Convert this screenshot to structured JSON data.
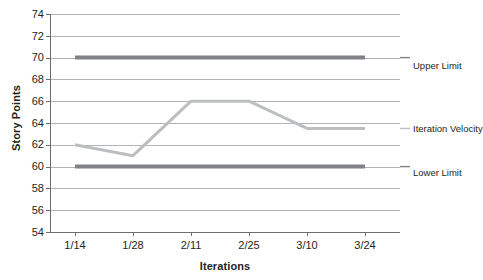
{
  "chart_data": {
    "type": "line",
    "title": "",
    "xlabel": "Iterations",
    "ylabel": "Story Points",
    "categories": [
      "1/14",
      "1/28",
      "2/11",
      "2/25",
      "3/10",
      "3/24"
    ],
    "ylim": [
      54,
      74
    ],
    "yticks": [
      74,
      72,
      70,
      68,
      66,
      64,
      62,
      60,
      58,
      56,
      54
    ],
    "grid": true,
    "legend_position": "right-inline",
    "series": [
      {
        "name": "Upper Limit",
        "values": [
          70,
          70,
          70,
          70,
          70,
          70
        ],
        "color": "#808285",
        "width": 4
      },
      {
        "name": "Iteration Velocity",
        "values": [
          62,
          61,
          66,
          66,
          63.5,
          63.5
        ],
        "color": "#bcbec0",
        "width": 3
      },
      {
        "name": "Lower Limit",
        "values": [
          60,
          60,
          60,
          60,
          60,
          60
        ],
        "color": "#808285",
        "width": 4
      }
    ]
  },
  "axis": {
    "y_title": "Story Points",
    "x_title": "Iterations",
    "y_tick_labels": [
      "74",
      "72",
      "70",
      "68",
      "66",
      "64",
      "62",
      "60",
      "58",
      "56",
      "54"
    ],
    "x_tick_labels": [
      "1/14",
      "1/28",
      "2/11",
      "2/25",
      "3/10",
      "3/24"
    ]
  },
  "legend": {
    "upper_limit": "Upper Limit",
    "iteration_velocity": "Iteration Velocity",
    "lower_limit": "Lower Limit"
  },
  "colors": {
    "limit_line": "#808285",
    "velocity_line": "#bcbec0",
    "gridline": "#9d9fa2",
    "axis": "#6d6e71",
    "text": "#231f20",
    "background": "#ffffff"
  }
}
